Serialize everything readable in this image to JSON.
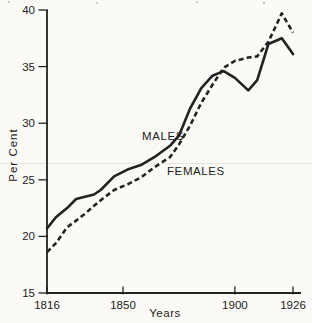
{
  "figure": {
    "background": "#fbfaf7",
    "ink": "#222222",
    "artifact_line_color": "#e6e5e0"
  },
  "chart_data": {
    "type": "line",
    "title": "",
    "xlabel": "Years",
    "ylabel": "Per Cent",
    "xlim": [
      1816,
      1926
    ],
    "ylim": [
      15,
      40
    ],
    "x_ticks": [
      1816,
      1850,
      1900,
      1926
    ],
    "y_ticks": [
      15,
      20,
      25,
      30,
      35,
      40
    ],
    "grid": false,
    "legend_position": "inline-labels",
    "x": [
      1816,
      1820,
      1825,
      1829,
      1833,
      1837,
      1840,
      1846,
      1852,
      1858,
      1864,
      1871,
      1875,
      1880,
      1885,
      1890,
      1895,
      1900,
      1906,
      1910,
      1915,
      1921,
      1926
    ],
    "series": [
      {
        "name": "MALES",
        "line_style": "solid",
        "values": [
          20.7,
          21.7,
          22.5,
          23.3,
          23.5,
          23.7,
          24.1,
          25.3,
          25.9,
          26.3,
          27.0,
          28.0,
          28.9,
          31.3,
          33.1,
          34.2,
          34.6,
          34.0,
          32.9,
          33.8,
          37.0,
          37.5,
          36.1
        ],
        "label": {
          "x": 142,
          "y": 140
        }
      },
      {
        "name": "FEMALES",
        "line_style": "dashed",
        "values": [
          18.6,
          19.4,
          20.8,
          21.4,
          22.0,
          22.7,
          23.2,
          24.1,
          24.6,
          25.2,
          26.1,
          27.0,
          28.1,
          29.8,
          31.8,
          33.4,
          34.9,
          35.5,
          35.8,
          35.9,
          37.2,
          39.7,
          38.0
        ],
        "label": {
          "x": 167,
          "y": 175
        }
      }
    ]
  }
}
